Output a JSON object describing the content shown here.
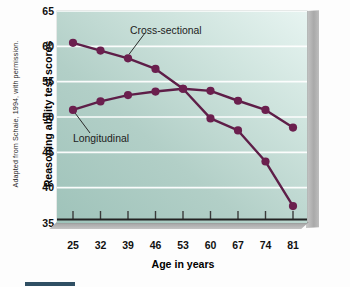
{
  "credit": "Adapted from Schaie, 1994, with permission.",
  "annotations": {
    "cross_sectional": "Cross-sectional",
    "longitudinal": "Longitudinal"
  },
  "chart_data": {
    "type": "line",
    "title": "",
    "xlabel": "Age in years",
    "ylabel": "Reasoning ability test scores",
    "categories": [
      25,
      32,
      39,
      46,
      53,
      60,
      67,
      74,
      81
    ],
    "xtick_labels": [
      "25",
      "32",
      "39",
      "46",
      "53",
      "60",
      "67",
      "74",
      "81"
    ],
    "ytick_labels": [
      "65",
      "60",
      "55",
      "50",
      "45",
      "40",
      "35"
    ],
    "yticks": [
      65,
      60,
      55,
      50,
      45,
      40,
      35
    ],
    "ylim": [
      35,
      65
    ],
    "xlim": [
      25,
      81
    ],
    "grid": "horizontal",
    "legend": "none",
    "series": [
      {
        "name": "Cross-sectional",
        "color": "#5e1e48",
        "values": [
          60.5,
          59.4,
          58.3,
          56.8,
          54.0,
          49.8,
          48.1,
          43.7,
          37.4
        ]
      },
      {
        "name": "Longitudinal",
        "color": "#5e1e48",
        "values": [
          51.0,
          52.2,
          53.1,
          53.6,
          54.0,
          53.7,
          52.3,
          51.0,
          48.5
        ]
      }
    ],
    "colors": {
      "line": "#5e1e48",
      "marker": "#6b1f4e",
      "plot_bg_light": "#e7f4f1",
      "plot_bg_dark": "#9fc3ba",
      "gridline": "#ffffff",
      "side_panel": "#a9a9a9"
    }
  }
}
